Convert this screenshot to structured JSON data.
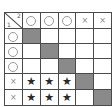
{
  "matrix": {
    "corner": {
      "top_right_label": "2",
      "bottom_left_label": "1"
    },
    "column_headers": [
      "circle",
      "circle",
      "circle",
      "cross",
      "cross"
    ],
    "row_headers": [
      "circle",
      "circle",
      "circle",
      "cross",
      "cross"
    ],
    "cells": [
      [
        "shade",
        "",
        "",
        "",
        ""
      ],
      [
        "",
        "shade",
        "",
        "",
        ""
      ],
      [
        "",
        "",
        "shade",
        "",
        ""
      ],
      [
        "star",
        "star",
        "star",
        "shade",
        ""
      ],
      [
        "star",
        "star",
        "star",
        "",
        "shade"
      ]
    ],
    "symbols": {
      "circle": "○",
      "cross": "×",
      "star": "★"
    },
    "colors": {
      "shade": "#8a8a8a",
      "border": "#4a4a4a",
      "star": "#2a2a2a"
    }
  }
}
